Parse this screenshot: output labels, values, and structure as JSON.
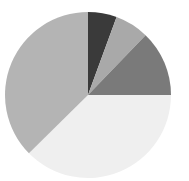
{
  "chart_data": {
    "type": "pie",
    "title": "",
    "start_angle_deg": 0,
    "direction": "clockwise",
    "legend": "none",
    "slices": [
      {
        "label": "",
        "value": 5.6,
        "color": "#3a3a3a"
      },
      {
        "label": "",
        "value": 6.6,
        "color": "#a9a9a9"
      },
      {
        "label": "",
        "value": 12.8,
        "color": "#7a7a7a"
      },
      {
        "label": "",
        "value": 37.6,
        "color": "#efefef"
      },
      {
        "label": "",
        "value": 37.4,
        "color": "#b4b4b4"
      }
    ],
    "geometry": {
      "cx": 88,
      "cy": 95,
      "r": 83
    }
  }
}
